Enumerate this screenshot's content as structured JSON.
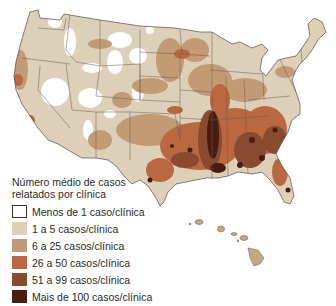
{
  "map": {
    "subject": "Estados Unidos — casos relatados por clínica",
    "colors": {
      "background": "#ffffff",
      "border": "#5a4a40",
      "level0": "#ffffff",
      "level1": "#dcd0b8",
      "level2": "#c29a74",
      "level3": "#b9683f",
      "level4": "#8a4a30",
      "level5": "#4a1c10"
    },
    "insets": [
      "Hawaii"
    ]
  },
  "legend": {
    "title_line1": "Número médio de casos",
    "title_line2": "relatados por clínica",
    "items": [
      {
        "label": "Menos de 1 caso/clínica",
        "color": "#ffffff"
      },
      {
        "label": "1 a 5 casos/clínica",
        "color": "#dcd0b8"
      },
      {
        "label": "6 a 25 casos/clínica",
        "color": "#c29a74"
      },
      {
        "label": "26 a 50 casos/clínica",
        "color": "#b9683f"
      },
      {
        "label": "51 a 99 casos/clínica",
        "color": "#8a4a30"
      },
      {
        "label": "Mais de 100 casos/clínica",
        "color": "#4a1c10"
      }
    ]
  }
}
